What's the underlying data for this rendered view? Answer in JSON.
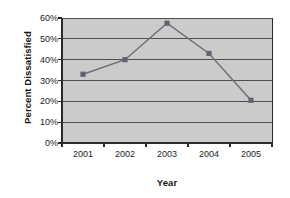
{
  "chart_data": {
    "type": "line",
    "title": "",
    "xlabel": "Year",
    "ylabel": "Percent Dissatisfied",
    "categories": [
      "2001",
      "2002",
      "2003",
      "2004",
      "2005"
    ],
    "x": [
      2001,
      2002,
      2003,
      2004,
      2005
    ],
    "values": [
      33,
      40,
      57.5,
      43,
      20.5
    ],
    "series": [
      {
        "name": "Percent Dissatisfied",
        "values": [
          33,
          40,
          57.5,
          43,
          20.5
        ]
      }
    ],
    "ylim": [
      0,
      60
    ],
    "xlim": [
      2001,
      2005
    ],
    "ytick_values": [
      0,
      10,
      20,
      30,
      40,
      50,
      60
    ],
    "ytick_labels": [
      "0%",
      "10%",
      "20%",
      "30%",
      "40%",
      "50%",
      "60%"
    ],
    "xtick_labels": [
      "2001",
      "2002",
      "2003",
      "2004",
      "2005"
    ],
    "grid": {
      "horizontal": true,
      "vertical": false
    },
    "legend": {
      "visible": false,
      "position": "none"
    },
    "marker": "square",
    "colors": {
      "line": "#6d6d78",
      "marker": "#63636f",
      "plot_background": "#cbcbcb",
      "gridline": "#4e4e4e",
      "axis": "#2a2a2a",
      "figure_background": "#ffffff",
      "text": "#1b1b1b"
    }
  }
}
